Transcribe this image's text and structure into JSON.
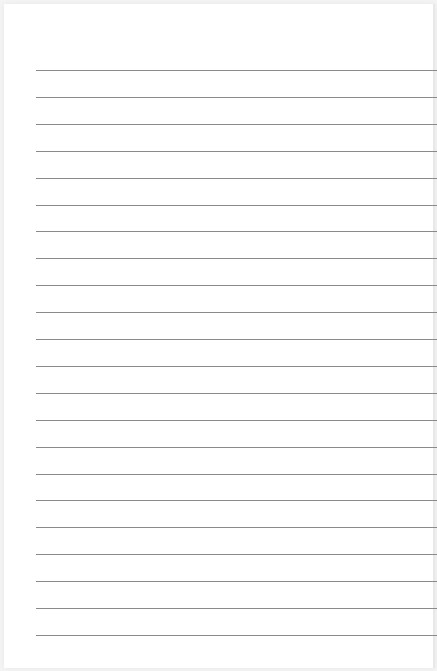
{
  "document": {
    "type": "lined-paper",
    "line_count": 22,
    "first_line_y": 70,
    "line_spacing": 26.9,
    "line_color": "#8a8a8a",
    "background": "#ffffff"
  }
}
